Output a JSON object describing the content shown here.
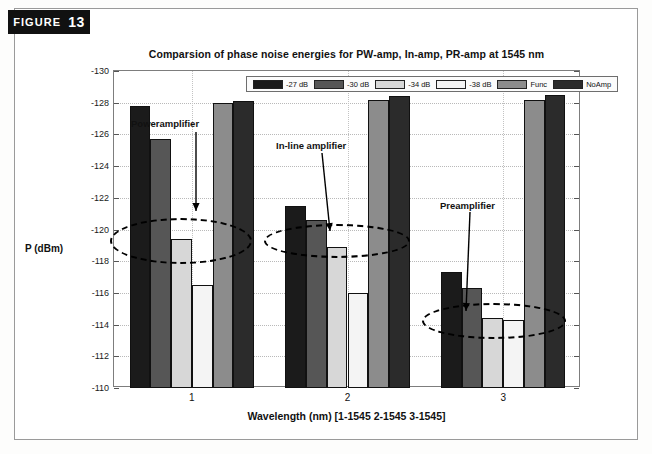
{
  "figure": {
    "badge_word": "FIGURE",
    "badge_number": "13"
  },
  "chart_data": {
    "type": "bar",
    "title": "Comparsion of phase noise energies for PW-amp, In-amp, PR-amp at 1545 nm",
    "xlabel": "Wavelength (nm) [1-1545  2-1545  3-1545]",
    "ylabel": "P (dBm)",
    "categories": [
      "1",
      "2",
      "3"
    ],
    "ylim": [
      -130,
      -110
    ],
    "y_inverted": true,
    "yticks": [
      "-130",
      "-128",
      "-126",
      "-124",
      "-122",
      "-120",
      "-118",
      "-116",
      "-114",
      "-112",
      "-110"
    ],
    "grid": true,
    "legend_position": "top-center",
    "series": [
      {
        "name": "-27 dB",
        "color": "#1b1b1b",
        "values": [
          -127.8,
          -121.5,
          -117.3
        ]
      },
      {
        "name": "-30 dB",
        "color": "#565656",
        "values": [
          -125.7,
          -120.6,
          -116.3
        ]
      },
      {
        "name": "-34 dB",
        "color": "#d7d7d7",
        "values": [
          -119.4,
          -118.9,
          -114.4
        ]
      },
      {
        "name": "-38 dB",
        "color": "#f4f4f4",
        "values": [
          -116.5,
          -116.0,
          -114.3
        ]
      },
      {
        "name": "Func",
        "color": "#8c8c8c",
        "values": [
          -128.0,
          -128.2,
          -128.2
        ]
      },
      {
        "name": "NoAmp",
        "color": "#2b2b2b",
        "values": [
          -128.1,
          -128.4,
          -128.5
        ]
      }
    ],
    "annotations": [
      {
        "label": "Poweramplifier",
        "target_group": "1",
        "target_series": "-34 dB"
      },
      {
        "label": "In-line amplifier",
        "target_group": "2",
        "target_series": "-34 dB"
      },
      {
        "label": "Preamplifier",
        "target_group": "3",
        "target_series": "-34 dB"
      }
    ]
  }
}
